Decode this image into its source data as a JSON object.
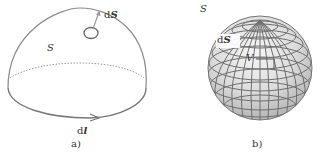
{
  "figure_a": {
    "caption": "a)",
    "surface_label": "S",
    "surface_element_label_prefix": "d",
    "surface_element_label_symbol": "S",
    "line_element_label_prefix": "d",
    "line_element_label_symbol": "l",
    "stroke_color": "#7a7a7a"
  },
  "figure_b": {
    "caption": "b)",
    "surface_label": "S",
    "surface_element_label_prefix": "d",
    "surface_element_label_symbol": "S",
    "volume_label": "V",
    "grid_color": "#6e6e6e",
    "fill_light": "#f2f2f2",
    "fill_dark": "#bdbdbd"
  }
}
